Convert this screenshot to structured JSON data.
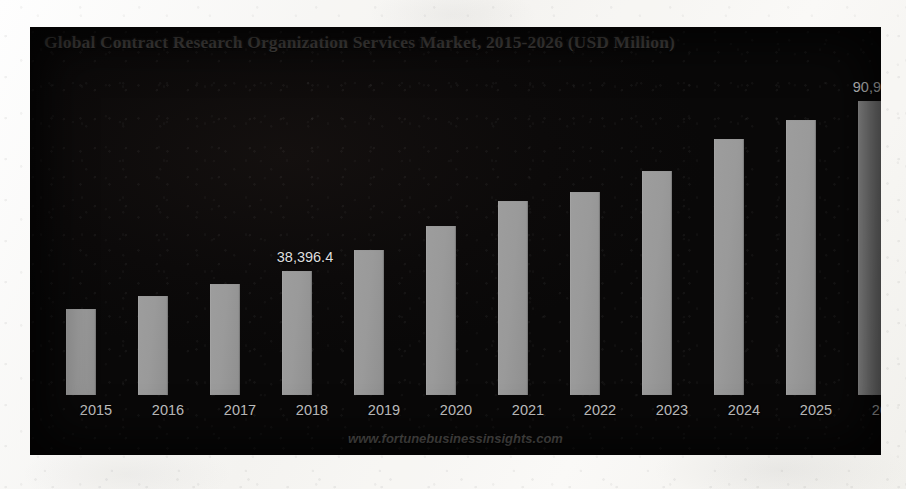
{
  "chart_data": {
    "type": "bar",
    "title": "Global Contract Research Organization Services Market, 2015-2026 (USD Million)",
    "xlabel": "",
    "ylabel": "USD Million",
    "grid": false,
    "legend": "none",
    "ylim": [
      0,
      100000
    ],
    "categories": [
      "2015",
      "2016",
      "2017",
      "2018",
      "2019",
      "2020",
      "2021",
      "2022",
      "2023",
      "2024",
      "2025",
      "2026"
    ],
    "values": [
      26800,
      30700,
      34400,
      38396.4,
      44900,
      52300,
      60000,
      62700,
      69300,
      79200,
      85000,
      90926.3
    ],
    "bar_pixel_tops": [
      308,
      295,
      283,
      270,
      249,
      225,
      200,
      191,
      170,
      138,
      119,
      100
    ],
    "baseline_pixel": 394,
    "labeled_points": [
      {
        "category": "2018",
        "label": "38,396.4"
      },
      {
        "category": "2026",
        "label": "90,926.3"
      }
    ],
    "annotations": [
      "38,396.4",
      "90,926.3"
    ],
    "watermark": "www.fortunebusinessinsights.com",
    "colors": {
      "bar": "#9a9a9a",
      "panel_background": "#0c0a0a",
      "title_text": "#4a4745",
      "axis_text": "#c8c8c8",
      "value_text": "#dedede",
      "page_background": "#f7f6f3"
    }
  },
  "bars": [
    {
      "year": "2015",
      "value_label": "",
      "height_px": 86,
      "x_px": 30
    },
    {
      "year": "2016",
      "value_label": "",
      "height_px": 99,
      "x_px": 102
    },
    {
      "year": "2017",
      "value_label": "",
      "height_px": 111,
      "x_px": 174
    },
    {
      "year": "2018",
      "value_label": "38,396.4",
      "height_px": 124,
      "x_px": 246
    },
    {
      "year": "2019",
      "value_label": "",
      "height_px": 145,
      "x_px": 318
    },
    {
      "year": "2020",
      "value_label": "",
      "height_px": 169,
      "x_px": 390
    },
    {
      "year": "2021",
      "value_label": "",
      "height_px": 194,
      "x_px": 462
    },
    {
      "year": "2022",
      "value_label": "",
      "height_px": 203,
      "x_px": 534
    },
    {
      "year": "2023",
      "value_label": "",
      "height_px": 224,
      "x_px": 606
    },
    {
      "year": "2024",
      "value_label": "",
      "height_px": 256,
      "x_px": 678
    },
    {
      "year": "2025",
      "value_label": "",
      "height_px": 275,
      "x_px": 750
    },
    {
      "year": "2026",
      "value_label": "90,926.3",
      "height_px": 294,
      "x_px": 822
    }
  ],
  "footer": {
    "watermark": "www.fortunebusinessinsights.com"
  }
}
